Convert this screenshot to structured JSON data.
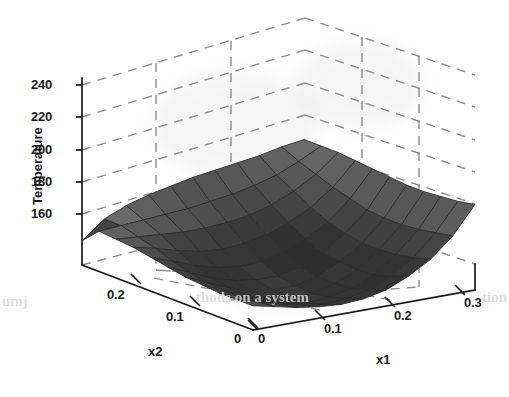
{
  "figure": {
    "background_color": "#ffffff",
    "axis_color": "#1a1a1a",
    "grid_color": "#8c8c8c",
    "mesh_line_color": "#2a2a2a"
  },
  "chart_data": {
    "type": "surface",
    "title": "",
    "xlabel": "x1",
    "ylabel": "x2",
    "zlabel": "Temperature",
    "grid": true,
    "legend": "none",
    "projection": "3d-mesh",
    "x": [
      0,
      0.03,
      0.06,
      0.09,
      0.12,
      0.15,
      0.18,
      0.21,
      0.24,
      0.27,
      0.3
    ],
    "y": [
      0,
      0.025,
      0.05,
      0.075,
      0.1,
      0.125,
      0.15,
      0.175,
      0.2,
      0.225,
      0.25
    ],
    "xlim": [
      0,
      0.3
    ],
    "ylim": [
      0,
      0.25
    ],
    "zlim": [
      150,
      245
    ],
    "xticks": [
      "0",
      "0.1",
      "0.2",
      "0.3"
    ],
    "xtick_values": [
      0,
      0.1,
      0.2,
      0.3
    ],
    "yticks": [
      "0",
      "0.1",
      "0.2"
    ],
    "ytick_values": [
      0,
      0.1,
      0.2
    ],
    "zticks": [
      "160",
      "180",
      "200",
      "220",
      "240"
    ],
    "ztick_values": [
      160,
      180,
      200,
      220,
      240
    ],
    "z": [
      [
        175,
        172,
        169,
        167,
        166,
        167,
        170,
        176,
        184,
        196,
        213
      ],
      [
        175,
        171,
        167,
        164,
        162,
        163,
        166,
        172,
        181,
        194,
        211
      ],
      [
        175,
        170,
        165,
        161,
        159,
        160,
        163,
        169,
        179,
        192,
        210
      ],
      [
        176,
        170,
        164,
        160,
        158,
        158,
        162,
        168,
        178,
        191,
        209
      ],
      [
        177,
        171,
        165,
        161,
        159,
        159,
        162,
        169,
        178,
        191,
        209
      ],
      [
        179,
        173,
        167,
        163,
        161,
        161,
        164,
        170,
        180,
        192,
        210
      ],
      [
        181,
        176,
        171,
        167,
        165,
        166,
        169,
        175,
        183,
        195,
        211
      ],
      [
        183,
        180,
        176,
        173,
        172,
        173,
        176,
        181,
        188,
        198,
        212
      ],
      [
        184,
        183,
        182,
        181,
        181,
        182,
        184,
        188,
        194,
        202,
        213
      ],
      [
        185,
        186,
        187,
        188,
        189,
        191,
        193,
        196,
        200,
        206,
        213
      ],
      [
        175,
        186,
        192,
        196,
        199,
        202,
        204,
        206,
        208,
        211,
        213
      ]
    ],
    "zmin_observed": 158,
    "zmax_observed": 213,
    "surface_description": "Saddle-shaped temperature response surface: flat plateau near 175 at the x1=0 edge, a broad valley minimum near 158 around x1=0.10-0.12, rising steeply to about 213 at x1=0.3, with a raised dark ridge along the high-x2 back edge."
  },
  "axes": {
    "x1": {
      "title": "x1",
      "ticks": [
        "0",
        "0.1",
        "0.2",
        "0.3"
      ]
    },
    "x2": {
      "title": "x2",
      "ticks": [
        "0.2",
        "0.1",
        "0"
      ]
    },
    "z": {
      "title": "Temperature",
      "ticks": [
        "240",
        "220",
        "200",
        "180",
        "160"
      ]
    }
  },
  "scan_artifacts": {
    "bleed_text_left": "umj",
    "bleed_text_center": "thods on a system",
    "bleed_text_right": "tion"
  }
}
